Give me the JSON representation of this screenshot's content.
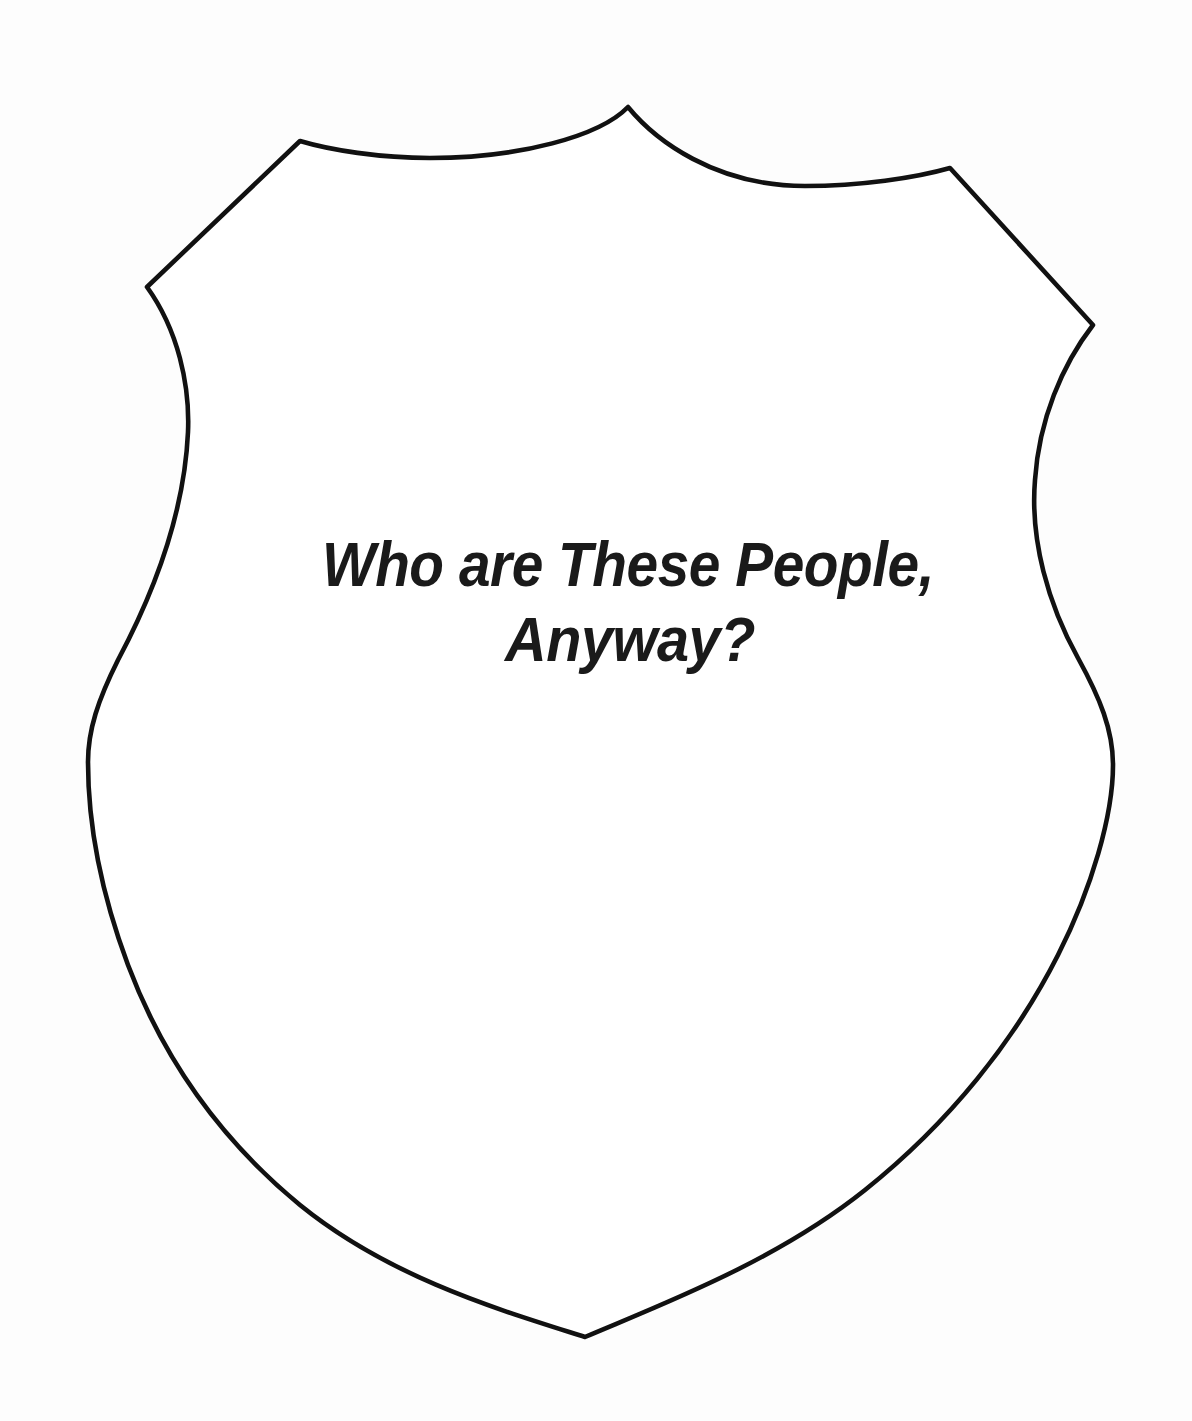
{
  "document": {
    "kind": "shield-badge-outline-template",
    "background_color": "#fdfdfd",
    "ink_color": "#111111"
  },
  "badge": {
    "shape_name": "police-shield-outline",
    "fill_color": "#ffffff",
    "stroke_color": "#111111",
    "stroke_width": "4.6",
    "title_lines": [
      "Who are These People,",
      "Anyway?"
    ],
    "title_full": "Who are These People, Anyway?",
    "title_color": "#1a1a1a",
    "title_style": "bold italic condensed",
    "geometry": {
      "top_apex": [
        628,
        107
      ],
      "left_shoulder_peak": [
        300,
        141
      ],
      "right_shoulder_peak": [
        950,
        168
      ],
      "left_corner": [
        147,
        287
      ],
      "right_corner": [
        1093,
        325
      ],
      "leftmost_point": [
        88,
        760
      ],
      "rightmost_point": [
        1113,
        765
      ],
      "bottom_point": [
        585,
        1337
      ]
    }
  }
}
